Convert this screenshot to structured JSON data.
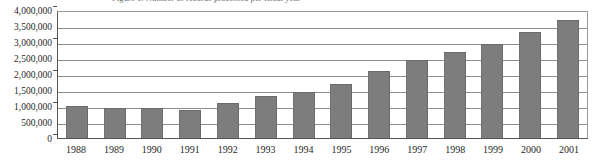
{
  "chart_data": {
    "type": "bar",
    "title": "Figure 1. Number of records processed per fiscal year",
    "xlabel": "",
    "ylabel": "",
    "ylim": [
      0,
      4000000
    ],
    "grid": true,
    "legend": "none",
    "categories": [
      "1988",
      "1989",
      "1990",
      "1991",
      "1992",
      "1993",
      "1994",
      "1995",
      "1996",
      "1997",
      "1998",
      "1999",
      "2000",
      "2001"
    ],
    "values": [
      1000000,
      930000,
      930000,
      880000,
      1090000,
      1300000,
      1450000,
      1700000,
      2100000,
      2450000,
      2700000,
      2930000,
      3300000,
      3700000
    ],
    "y_ticks": [
      {
        "label": "4,000,000",
        "value": 4000000
      },
      {
        "label": "3,500,000",
        "value": 3500000
      },
      {
        "label": "3,000,000",
        "value": 3000000
      },
      {
        "label": "2,500,000",
        "value": 2500000
      },
      {
        "label": "2,000,000",
        "value": 2000000
      },
      {
        "label": "1,500,000",
        "value": 1500000
      },
      {
        "label": "1,000,000",
        "value": 1000000
      },
      {
        "label": "500,000",
        "value": 500000
      },
      {
        "label": "0",
        "value": 0
      }
    ],
    "colors": {
      "bar_fill": "#7d7d7d",
      "bar_border": "#6a6a6a",
      "gridline": "#8d8d8d",
      "axis": "#555555",
      "background": "#ffffff",
      "text": "#1f1f1f"
    }
  }
}
